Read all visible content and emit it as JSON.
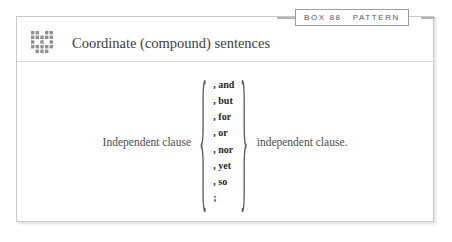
{
  "header": {
    "box_label": "BOX 88",
    "category_label": "PATTERN"
  },
  "title": {
    "icon": "pattern-grid-icon",
    "text": "Coordinate (compound) sentences"
  },
  "formula": {
    "left_clause": "Independent clause",
    "right_clause": "independent clause.",
    "open_brace": "{",
    "close_brace": "}",
    "conjunctions": [
      ", and",
      ", but",
      ", for",
      ", or",
      ", nor",
      ", yet",
      ", so",
      ";"
    ]
  },
  "colors": {
    "frame_border": "#c8c8c8",
    "tab_border": "#9c9c9c",
    "text": "#4a4a4a",
    "bold_text": "#262626",
    "icon": "#8f8f8f",
    "connector": "#b4b4b4"
  }
}
